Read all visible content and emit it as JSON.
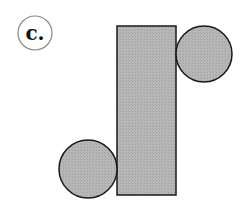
{
  "label": {
    "text": "c.",
    "cx": 35,
    "cy": 33,
    "r": 17,
    "stroke": "#888888"
  },
  "shapes": {
    "fill": "#b3b3b3",
    "stroke": "#1a1a1a",
    "rectangle": {
      "x": 117,
      "y": 26,
      "width": 59,
      "height": 169
    },
    "circle_top_right": {
      "cx": 204,
      "cy": 54,
      "r": 28
    },
    "circle_bottom_left": {
      "cx": 88,
      "cy": 169,
      "r": 29
    }
  }
}
